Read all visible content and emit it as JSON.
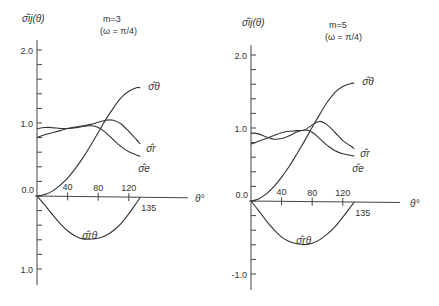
{
  "chart_data": [
    {
      "type": "line",
      "title": "m=3",
      "subtitle": "(ω = π/4)",
      "ylabel": "σ̂ij(θ)",
      "xlabel": "θ°",
      "xlim": [
        0,
        135
      ],
      "ylim": [
        -1.2,
        2.2
      ],
      "x_ticks": [
        40,
        80,
        120,
        135
      ],
      "x_tick_labels": [
        "40",
        "80",
        "120",
        "135"
      ],
      "y_tick_labels": [
        {
          "value": 2.0,
          "label": "2.0"
        },
        {
          "value": 1.0,
          "label": "1.0"
        },
        {
          "value": 0.0,
          "label": "0.0"
        },
        {
          "value": -1.0,
          "label": "1.0"
        }
      ],
      "y_minor_step": 0.2,
      "grid": false,
      "legend": "inline labels at curve ends",
      "series": [
        {
          "name": "σ̂θ",
          "label": "σ̂θ",
          "x": [
            0,
            10,
            20,
            30,
            40,
            50,
            60,
            70,
            80,
            90,
            100,
            110,
            120,
            130,
            135
          ],
          "values": [
            0.0,
            0.02,
            0.07,
            0.15,
            0.25,
            0.38,
            0.53,
            0.7,
            0.88,
            1.06,
            1.22,
            1.36,
            1.45,
            1.5,
            1.5
          ]
        },
        {
          "name": "σ̂r",
          "label": "σ̂r",
          "x": [
            0,
            10,
            20,
            30,
            40,
            50,
            60,
            70,
            80,
            90,
            100,
            110,
            120,
            130,
            135
          ],
          "values": [
            0.8,
            0.84,
            0.87,
            0.9,
            0.93,
            0.95,
            0.97,
            0.99,
            1.02,
            1.05,
            1.05,
            1.0,
            0.9,
            0.79,
            0.73
          ]
        },
        {
          "name": "σ̂e",
          "label": "σ̂e",
          "x": [
            0,
            10,
            20,
            30,
            40,
            50,
            60,
            70,
            80,
            90,
            100,
            110,
            120,
            130,
            135
          ],
          "values": [
            0.92,
            0.94,
            0.94,
            0.93,
            0.93,
            0.94,
            0.96,
            0.97,
            0.95,
            0.88,
            0.78,
            0.69,
            0.62,
            0.58,
            0.56
          ]
        },
        {
          "name": "σ̂rθ",
          "label": "σ̂rθ",
          "x": [
            0,
            10,
            20,
            30,
            40,
            50,
            60,
            70,
            80,
            90,
            100,
            110,
            120,
            130,
            135
          ],
          "values": [
            0.0,
            -0.12,
            -0.25,
            -0.37,
            -0.47,
            -0.54,
            -0.58,
            -0.58,
            -0.57,
            -0.53,
            -0.46,
            -0.36,
            -0.23,
            -0.08,
            0.0
          ]
        }
      ]
    },
    {
      "type": "line",
      "title": "m=5",
      "subtitle": "(ω = π/4)",
      "ylabel": "σ̂ij(θ)",
      "xlabel": "θ°",
      "xlim": [
        0,
        135
      ],
      "ylim": [
        -1.2,
        2.2
      ],
      "x_ticks": [
        40,
        80,
        120,
        135
      ],
      "x_tick_labels": [
        "40",
        "80",
        "120",
        "135"
      ],
      "y_tick_labels": [
        {
          "value": 2.0,
          "label": "2.0"
        },
        {
          "value": 1.0,
          "label": "1.0"
        },
        {
          "value": 0.0,
          "label": "0.0"
        },
        {
          "value": -1.0,
          "label": "-1.0"
        }
      ],
      "y_minor_step": 0.2,
      "grid": false,
      "legend": "inline labels at curve ends",
      "series": [
        {
          "name": "σ̂θ",
          "label": "σ̂θ",
          "x": [
            0,
            10,
            20,
            30,
            40,
            50,
            60,
            70,
            80,
            90,
            100,
            110,
            120,
            130,
            135
          ],
          "values": [
            0.0,
            0.03,
            0.1,
            0.2,
            0.33,
            0.48,
            0.65,
            0.83,
            1.02,
            1.2,
            1.37,
            1.5,
            1.58,
            1.62,
            1.63
          ]
        },
        {
          "name": "σ̂r",
          "label": "σ̂r",
          "x": [
            0,
            10,
            20,
            30,
            40,
            50,
            60,
            70,
            80,
            90,
            100,
            110,
            120,
            130,
            135
          ],
          "values": [
            0.78,
            0.82,
            0.86,
            0.9,
            0.94,
            0.96,
            0.97,
            0.98,
            1.05,
            1.1,
            1.05,
            0.95,
            0.84,
            0.77,
            0.73
          ]
        },
        {
          "name": "σ̂e",
          "label": "σ̂e",
          "x": [
            0,
            10,
            20,
            30,
            40,
            50,
            60,
            70,
            80,
            90,
            100,
            110,
            120,
            130,
            135
          ],
          "values": [
            0.93,
            0.92,
            0.88,
            0.85,
            0.86,
            0.9,
            0.95,
            0.98,
            0.95,
            0.86,
            0.77,
            0.7,
            0.66,
            0.64,
            0.63
          ]
        },
        {
          "name": "σ̂rθ",
          "label": "σ̂rθ",
          "x": [
            0,
            10,
            20,
            30,
            40,
            50,
            60,
            70,
            80,
            90,
            100,
            110,
            120,
            130,
            135
          ],
          "values": [
            0.0,
            -0.13,
            -0.27,
            -0.39,
            -0.49,
            -0.55,
            -0.58,
            -0.59,
            -0.57,
            -0.52,
            -0.44,
            -0.34,
            -0.21,
            -0.07,
            0.0
          ]
        }
      ]
    }
  ],
  "panels": [
    {
      "ylabel": "σ̂ij(θ)",
      "title": "m=3",
      "subtitle": "(ω = π/4)",
      "xlabel": "θ°",
      "origin_label": "0.0"
    },
    {
      "ylabel": "σ̂ij(θ)",
      "title": "m=5",
      "subtitle": "(ω = π/4)",
      "xlabel": "θ°",
      "origin_label": "0.0"
    }
  ]
}
